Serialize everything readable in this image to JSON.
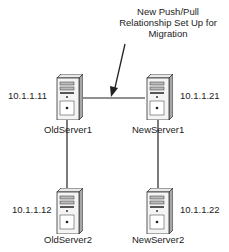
{
  "diagram": {
    "callout": {
      "lines": [
        "New Push/Pull",
        "Relationship Set Up for",
        "Migration"
      ]
    },
    "servers": [
      {
        "name": "OldServer1",
        "ip": "10.1.1.11"
      },
      {
        "name": "NewServer1",
        "ip": "10.1.1.21"
      },
      {
        "name": "OldServer2",
        "ip": "10.1.1.12"
      },
      {
        "name": "NewServer2",
        "ip": "10.1.1.22"
      }
    ],
    "connections": [
      {
        "from": "OldServer1",
        "to": "NewServer1",
        "type": "new push/pull"
      },
      {
        "from": "OldServer1",
        "to": "OldServer2"
      },
      {
        "from": "NewServer1",
        "to": "NewServer2"
      }
    ]
  }
}
